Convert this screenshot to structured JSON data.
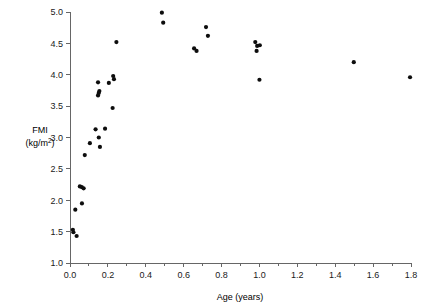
{
  "chart_data": {
    "type": "scatter",
    "title": "",
    "xlabel": "Age (years)",
    "ylabel": "FMI (kg/m2)",
    "ylabel_line1": "FMI",
    "ylabel_line2_prefix": "(kg/m",
    "ylabel_line2_exponent": "2",
    "ylabel_line2_suffix": ")",
    "xlim": [
      0.0,
      1.8
    ],
    "ylim": [
      1.0,
      5.0
    ],
    "xticks": [
      0.0,
      0.2,
      0.4,
      0.6,
      0.8,
      1.0,
      1.2,
      1.4,
      1.6,
      1.8
    ],
    "xtick_labels": [
      "0.0",
      "0.2",
      "0.4",
      "0.6",
      "0.8",
      "1.0",
      "1.2",
      "1.4",
      "1.6",
      "1.8"
    ],
    "xminor_step": 0.1,
    "yticks": [
      1.0,
      1.5,
      2.0,
      2.5,
      3.0,
      3.5,
      4.0,
      4.5,
      5.0
    ],
    "ytick_labels": [
      "1.0",
      "1.5",
      "2.0",
      "2.5",
      "3.0",
      "3.5",
      "4.0",
      "4.5",
      "5.0"
    ],
    "grid": false,
    "legend": false,
    "marker": "circle",
    "marker_color": "#0d0d0d",
    "marker_size_px": 4.2,
    "n_points": 41,
    "points": [
      {
        "x": 0.015,
        "y": 1.53
      },
      {
        "x": 0.018,
        "y": 1.49
      },
      {
        "x": 0.035,
        "y": 1.43
      },
      {
        "x": 0.028,
        "y": 1.85
      },
      {
        "x": 0.063,
        "y": 1.95
      },
      {
        "x": 0.052,
        "y": 2.22
      },
      {
        "x": 0.062,
        "y": 2.21
      },
      {
        "x": 0.072,
        "y": 2.19
      },
      {
        "x": 0.078,
        "y": 2.72
      },
      {
        "x": 0.105,
        "y": 2.91
      },
      {
        "x": 0.135,
        "y": 3.13
      },
      {
        "x": 0.152,
        "y": 3.0
      },
      {
        "x": 0.158,
        "y": 2.85
      },
      {
        "x": 0.185,
        "y": 3.14
      },
      {
        "x": 0.148,
        "y": 3.88
      },
      {
        "x": 0.155,
        "y": 3.74
      },
      {
        "x": 0.152,
        "y": 3.71
      },
      {
        "x": 0.148,
        "y": 3.67
      },
      {
        "x": 0.205,
        "y": 3.87
      },
      {
        "x": 0.228,
        "y": 3.98
      },
      {
        "x": 0.232,
        "y": 3.93
      },
      {
        "x": 0.225,
        "y": 3.47
      },
      {
        "x": 0.245,
        "y": 4.52
      },
      {
        "x": 0.485,
        "y": 4.99
      },
      {
        "x": 0.492,
        "y": 4.83
      },
      {
        "x": 0.655,
        "y": 4.42
      },
      {
        "x": 0.668,
        "y": 4.38
      },
      {
        "x": 0.718,
        "y": 4.76
      },
      {
        "x": 0.728,
        "y": 4.62
      },
      {
        "x": 0.978,
        "y": 4.52
      },
      {
        "x": 0.988,
        "y": 4.46
      },
      {
        "x": 1.002,
        "y": 4.47
      },
      {
        "x": 0.985,
        "y": 4.38
      },
      {
        "x": 1.0,
        "y": 3.92
      },
      {
        "x": 1.498,
        "y": 4.2
      },
      {
        "x": 1.795,
        "y": 3.96
      }
    ]
  }
}
